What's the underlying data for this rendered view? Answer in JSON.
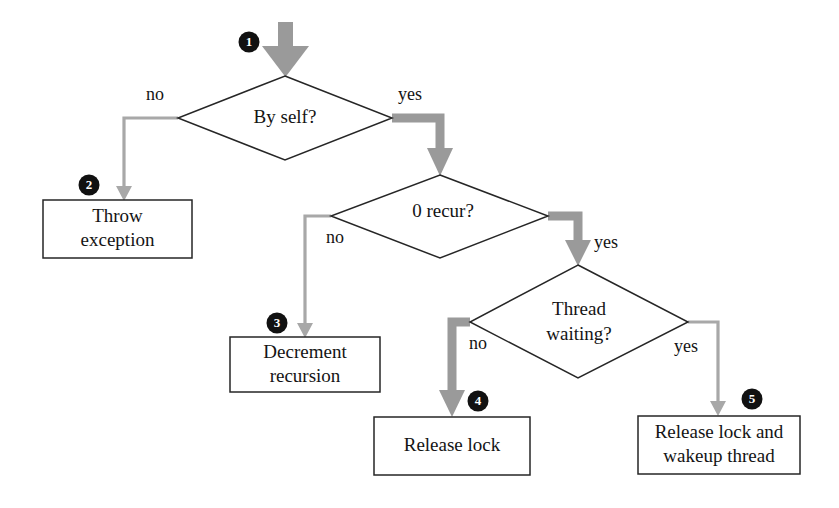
{
  "diagram": {
    "background_color": "#ffffff",
    "shape_stroke_color": "#262626",
    "arrow_color_thick": "#9a9a9a",
    "arrow_color_thin": "#a8a8a8",
    "marker_fill_color": "#111111",
    "marker_text_color": "#ffffff"
  },
  "nodes": {
    "decision_by_self": {
      "label": "By self?",
      "type": "decision"
    },
    "decision_zero_recur": {
      "label": "0 recur?",
      "type": "decision"
    },
    "decision_thread_waiting": {
      "label_line1": "Thread",
      "label_line2": "waiting?",
      "type": "decision"
    },
    "process_throw_exception": {
      "label_line1": "Throw",
      "label_line2": "exception",
      "type": "process"
    },
    "process_decrement_recursion": {
      "label_line1": "Decrement",
      "label_line2": "recursion",
      "type": "process"
    },
    "process_release_lock": {
      "label": "Release lock",
      "type": "process"
    },
    "process_release_lock_wakeup": {
      "label_line1": "Release lock and",
      "label_line2": "wakeup thread",
      "type": "process"
    }
  },
  "edge_labels": {
    "by_self_no": "no",
    "by_self_yes": "yes",
    "zero_recur_no": "no",
    "zero_recur_yes": "yes",
    "thread_waiting_no": "no",
    "thread_waiting_yes": "yes"
  },
  "markers": [
    {
      "id": "marker-1",
      "number": "1",
      "target": "entry-arrow"
    },
    {
      "id": "marker-2",
      "number": "2",
      "target": "process_throw_exception"
    },
    {
      "id": "marker-3",
      "number": "3",
      "target": "process_decrement_recursion"
    },
    {
      "id": "marker-4",
      "number": "4",
      "target": "process_release_lock"
    },
    {
      "id": "marker-5",
      "number": "5",
      "target": "process_release_lock_wakeup"
    }
  ]
}
